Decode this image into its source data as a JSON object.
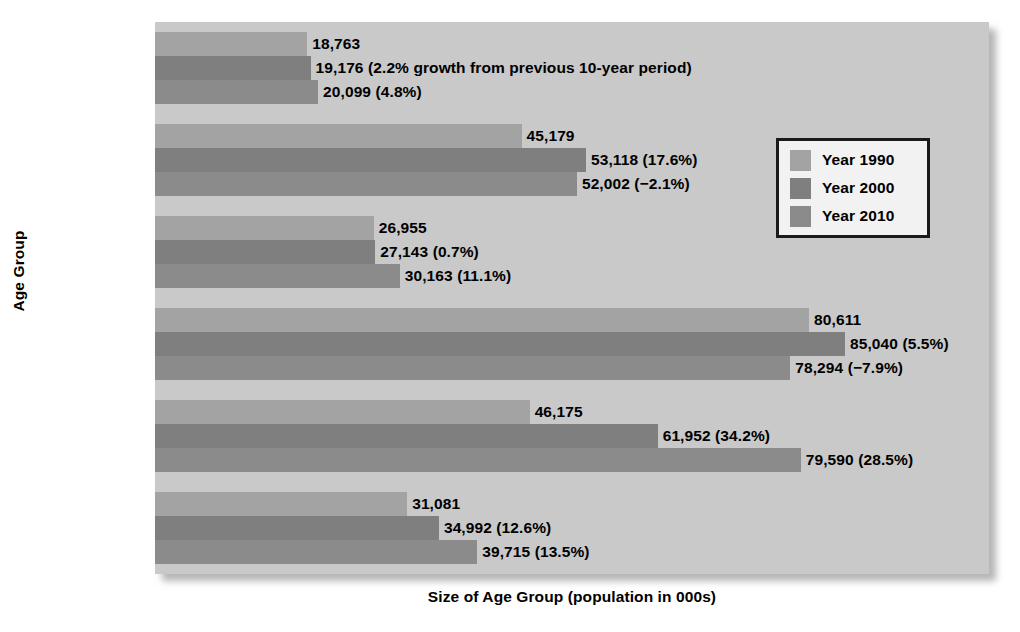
{
  "chart_data": {
    "type": "bar",
    "orientation": "horizontal",
    "title": "",
    "xlabel": "Size of Age Group (population in 000s)",
    "ylabel": "Age Group",
    "categories": [
      "Under 5",
      "5–17",
      "18–24",
      "25–44",
      "45–64",
      "65+"
    ],
    "grid": false,
    "legend_position": "upper-right",
    "xlim": [
      0,
      85040
    ],
    "series": [
      {
        "name": "Year 1990",
        "color": "#a3a3a3",
        "values": [
          18763,
          45179,
          26955,
          80611,
          46175,
          31081
        ],
        "labels": [
          "18,763",
          "45,179",
          "26,955",
          "80,611",
          "46,175",
          "31,081"
        ]
      },
      {
        "name": "Year 2000",
        "color": "#7f7f7f",
        "values": [
          19176,
          53118,
          27143,
          85040,
          61952,
          34992
        ],
        "labels": [
          "19,176 (2.2% growth from previous 10-year period)",
          "53,118 (17.6%)",
          "27,143 (0.7%)",
          "85,040 (5.5%)",
          "61,952 (34.2%)",
          "34,992 (12.6%)"
        ]
      },
      {
        "name": "Year 2010",
        "color": "#8b8b8b",
        "values": [
          20099,
          52002,
          30163,
          78294,
          79590,
          39715
        ],
        "labels": [
          "20,099 (4.8%)",
          "52,002 (−2.1%)",
          "30,163 (11.1%)",
          "78,294 (−7.9%)",
          "79,590 (28.5%)",
          "39,715 (13.5%)"
        ]
      }
    ]
  },
  "legend": {
    "entries": [
      {
        "label": "Year 1990",
        "swatch": "s1990"
      },
      {
        "label": "Year 2000",
        "swatch": "s2000"
      },
      {
        "label": "Year 2010",
        "swatch": "s2010"
      }
    ]
  },
  "colors": {
    "plot_background": "#c9c9c9",
    "page_background": "#ffffff",
    "series_1990": "#a3a3a3",
    "series_2000": "#7f7f7f",
    "series_2010": "#8b8b8b",
    "text": "#000000",
    "legend_border": "#1a1a1a",
    "legend_background": "#f2f2f2"
  }
}
